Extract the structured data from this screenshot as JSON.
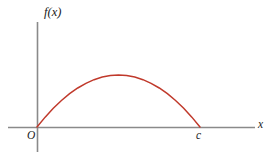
{
  "figure": {
    "background_color": "#ffffff",
    "width": 273,
    "height": 158,
    "axis_color": "#8a8a8a",
    "curve_color": "#c0392b",
    "label_color": "#1a1a1a"
  },
  "labels": {
    "y_axis": "f(x)",
    "x_axis": "x",
    "origin": "O",
    "root_right": "c"
  },
  "chart_data": {
    "type": "line",
    "title": "",
    "subtitle": "",
    "xlabel": "x",
    "ylabel": "f(x)",
    "legend": [],
    "legend_position": "none",
    "grid": false,
    "axes": {
      "origin_label": "O",
      "x_axis_y_pixel": 127,
      "y_axis_x_pixel": 37,
      "x_axis_start_pixel": 8,
      "x_axis_end_pixel": 255,
      "y_axis_top_pixel": 22,
      "y_axis_bottom_pixel": 152,
      "x_tick_labels": [
        "O",
        "c"
      ],
      "y_tick_labels": []
    },
    "annotations": [
      {
        "text": "O",
        "x": 0,
        "y": 0,
        "position": "below-left-of-origin"
      },
      {
        "text": "c",
        "x": 1,
        "y": 0,
        "position": "below-right-root"
      },
      {
        "text": "f(x)",
        "x": 0,
        "y": 1,
        "position": "above-y-axis"
      },
      {
        "text": "x",
        "x": 1,
        "y": 0,
        "position": "right-of-x-axis"
      }
    ],
    "series": [
      {
        "name": "f(x)",
        "color": "#c0392b",
        "roots": [
          0,
          1
        ],
        "vertex": [
          0.4969,
          1.0
        ],
        "x": [
          0.0,
          0.05,
          0.1,
          0.15,
          0.2,
          0.25,
          0.3,
          0.35,
          0.4,
          0.45,
          0.5,
          0.55,
          0.6,
          0.65,
          0.7,
          0.75,
          0.8,
          0.85,
          0.9,
          0.95,
          1.0
        ],
        "values": [
          0.0,
          0.19,
          0.36,
          0.51,
          0.64,
          0.75,
          0.84,
          0.91,
          0.96,
          0.99,
          1.0,
          0.99,
          0.96,
          0.91,
          0.84,
          0.75,
          0.64,
          0.51,
          0.36,
          0.19,
          0.0
        ]
      }
    ],
    "xlim": [
      0,
      1
    ],
    "ylim": [
      0,
      1
    ]
  }
}
